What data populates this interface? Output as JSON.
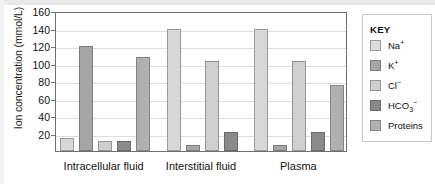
{
  "chart_data": {
    "type": "bar",
    "title": "",
    "xlabel": "",
    "ylabel": "Ion concentration (mmol/L)",
    "ylim": [
      0,
      160
    ],
    "yticks": [
      20,
      40,
      60,
      80,
      100,
      120,
      140,
      160
    ],
    "grid": true,
    "legend_position": "right",
    "legend_title": "KEY",
    "categories": [
      "Intracellular fluid",
      "Interstitial fluid",
      "Plasma"
    ],
    "series": [
      {
        "name": "Na+",
        "label_html": "Na<sup>+</sup>",
        "color": "#dcdcdc",
        "values": [
          15,
          140,
          140
        ]
      },
      {
        "name": "K+",
        "label_html": "K<sup>+</sup>",
        "color": "#a6a6a6",
        "values": [
          120,
          7,
          7
        ]
      },
      {
        "name": "Cl-",
        "label_html": "Cl<sup>&minus;</sup>",
        "color": "#cfcfcf",
        "values": [
          11,
          103,
          103
        ]
      },
      {
        "name": "HCO3-",
        "label_html": "HCO<sub>3</sub><sup>&minus;</sup>",
        "color": "#8a8a8a",
        "values": [
          11,
          22,
          22
        ]
      },
      {
        "name": "Proteins",
        "label_html": "Proteins",
        "color": "#b0b0b0",
        "values": [
          107,
          null,
          76
        ]
      }
    ]
  },
  "axis": {
    "y_title": "Ion concentration (mmol/L)",
    "y_tick_labels": [
      "160",
      "140",
      "120",
      "100",
      "80",
      "60",
      "40",
      "20"
    ]
  },
  "legend": {
    "title": "KEY",
    "items": [
      {
        "label": "Na+",
        "swatch": "na"
      },
      {
        "label": "K+",
        "swatch": "k"
      },
      {
        "label": "Cl-",
        "swatch": "cl"
      },
      {
        "label": "HCO3-",
        "swatch": "hco3"
      },
      {
        "label": "Proteins",
        "swatch": "prot"
      }
    ]
  }
}
